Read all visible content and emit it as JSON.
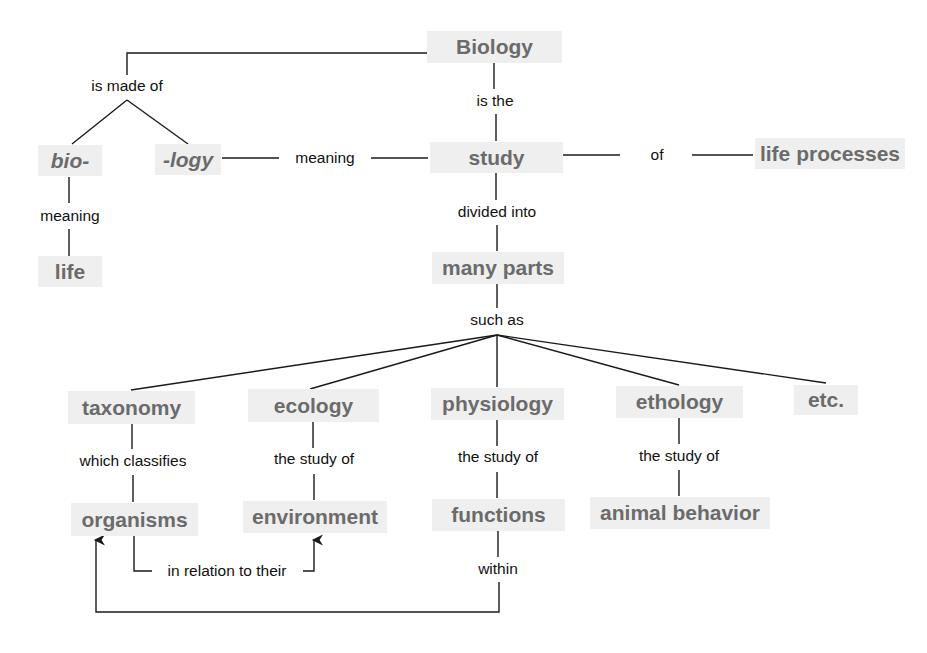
{
  "concepts": {
    "biology": "Biology",
    "bio": "bio-",
    "logy": "-logy",
    "life": "life",
    "study": "study",
    "life_processes": "life processes",
    "many_parts": "many parts",
    "taxonomy": "taxonomy",
    "ecology": "ecology",
    "physiology": "physiology",
    "ethology": "ethology",
    "etc": "etc.",
    "organisms": "organisms",
    "environment": "environment",
    "functions": "functions",
    "animal_behavior": "animal behavior"
  },
  "links": {
    "is_made_of": "is made of",
    "bio_meaning": "meaning",
    "logy_meaning": "meaning",
    "is_the": "is the",
    "of": "of",
    "divided_into": "divided into",
    "such_as": "such as",
    "which_classifies": "which classifies",
    "ecology_study_of": "the study of",
    "physiology_study_of": "the study of",
    "ethology_study_of": "the study of",
    "in_relation_to_their": "in relation to their",
    "within": "within"
  },
  "colors": {
    "concept_bg": "#efefef",
    "concept_text": "#6b6b6b",
    "link_text": "#111111",
    "line": "#1a1a1a"
  }
}
